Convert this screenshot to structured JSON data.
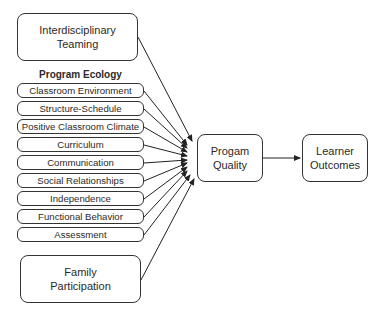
{
  "diagram": {
    "inputs": {
      "teaming": {
        "label_line1": "Interdisciplinary",
        "label_line2": "Teaming"
      },
      "program_ecology": {
        "title": "Program Ecology",
        "items": [
          {
            "label": "Classroom Environment"
          },
          {
            "label": "Structure-Schedule"
          },
          {
            "label": "Positive Classroom Climate"
          },
          {
            "label": "Curriculum"
          },
          {
            "label": "Communication"
          },
          {
            "label": "Social Relationships"
          },
          {
            "label": "Independence"
          },
          {
            "label": "Functional Behavior"
          },
          {
            "label": "Assessment"
          }
        ]
      },
      "family": {
        "label_line1": "Family",
        "label_line2": "Participation"
      }
    },
    "program_quality": {
      "label_line1": "Progam",
      "label_line2": "Quality"
    },
    "learner_outcomes": {
      "label_line1": "Learner",
      "label_line2": "Outcomes"
    },
    "edges": [
      {
        "from": "Interdisciplinary Teaming",
        "to": "Progam Quality"
      },
      {
        "from": "Classroom Environment",
        "to": "Progam Quality"
      },
      {
        "from": "Structure-Schedule",
        "to": "Progam Quality"
      },
      {
        "from": "Positive Classroom Climate",
        "to": "Progam Quality"
      },
      {
        "from": "Curriculum",
        "to": "Progam Quality"
      },
      {
        "from": "Communication",
        "to": "Progam Quality"
      },
      {
        "from": "Social Relationships",
        "to": "Progam Quality"
      },
      {
        "from": "Independence",
        "to": "Progam Quality"
      },
      {
        "from": "Functional Behavior",
        "to": "Progam Quality"
      },
      {
        "from": "Assessment",
        "to": "Progam Quality"
      },
      {
        "from": "Family Participation",
        "to": "Progam Quality"
      },
      {
        "from": "Progam Quality",
        "to": "Learner Outcomes"
      }
    ]
  }
}
